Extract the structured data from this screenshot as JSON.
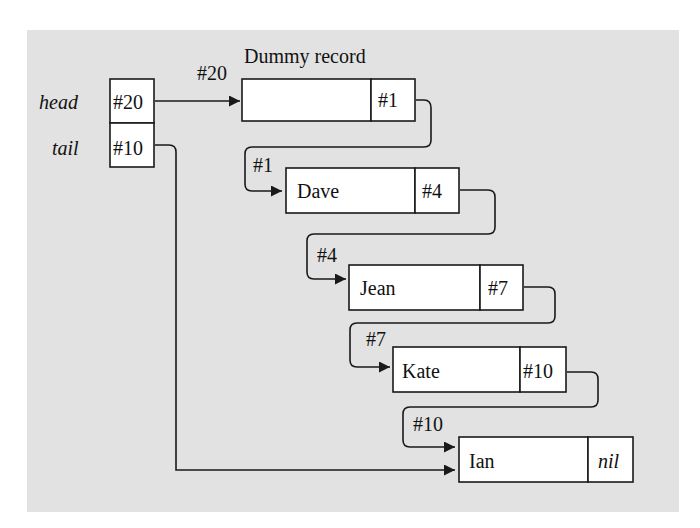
{
  "diagram": {
    "title": "Dummy record",
    "colors": {
      "background": "#e2e2e2",
      "box_fill": "#ffffff",
      "stroke": "#1a1a1a"
    },
    "pointers": {
      "head": {
        "label": "head",
        "value": "#20"
      },
      "tail": {
        "label": "tail",
        "value": "#10"
      }
    },
    "head_arrow_label": "#20",
    "records": [
      {
        "name": "",
        "next": "#1",
        "address": "#20"
      },
      {
        "name": "Dave",
        "next": "#4",
        "address": "#1"
      },
      {
        "name": "Jean",
        "next": "#7",
        "address": "#4"
      },
      {
        "name": "Kate",
        "next": "#10",
        "address": "#7"
      },
      {
        "name": "Ian",
        "next": "nil",
        "address": "#10"
      }
    ]
  }
}
